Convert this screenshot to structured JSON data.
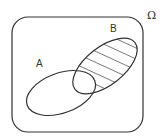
{
  "diagram": {
    "type": "venn",
    "universe_label": "Ω",
    "sets": [
      {
        "id": "A",
        "label": "A"
      },
      {
        "id": "B",
        "label": "B"
      }
    ],
    "shaded_region": "B \\ A",
    "shading_style": "hatched",
    "stroke_color": "#333333",
    "background": "#ffffff"
  }
}
